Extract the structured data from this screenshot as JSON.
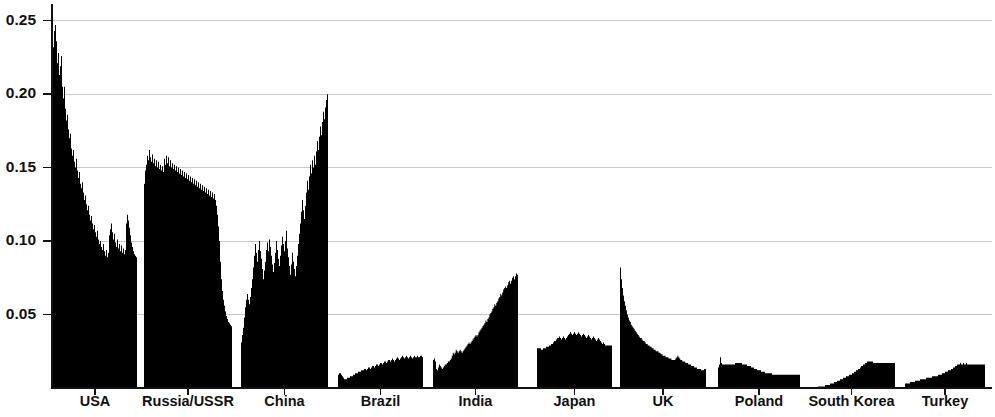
{
  "chart_data": {
    "type": "area",
    "title": "",
    "subtitle": "",
    "xlabel": "",
    "ylabel": "",
    "ylim": [
      0,
      0.26
    ],
    "grid": true,
    "legend_position": "none",
    "fill_color": "#000000",
    "grid_color": "#c8c8c8",
    "axis_color": "#111111",
    "y_ticks": [
      {
        "value": 0.05,
        "label": "0.05"
      },
      {
        "value": 0.1,
        "label": "0.10"
      },
      {
        "value": 0.15,
        "label": "0.15"
      },
      {
        "value": 0.2,
        "label": "0.20"
      },
      {
        "value": 0.25,
        "label": "0.25"
      }
    ],
    "categories": [
      "USA",
      "Russia/USSR",
      "China",
      "Brazil",
      "India",
      "Japan",
      "UK",
      "Poland",
      "South Korea",
      "Turkey"
    ],
    "panels": [
      {
        "name": "USA",
        "label": "USA",
        "x_start_px": 53,
        "x_end_px": 137,
        "peak_value": 0.247,
        "values": [
          0.232,
          0.243,
          0.247,
          0.236,
          0.221,
          0.228,
          0.213,
          0.219,
          0.226,
          0.205,
          0.197,
          0.205,
          0.19,
          0.182,
          0.186,
          0.176,
          0.17,
          0.173,
          0.163,
          0.158,
          0.162,
          0.154,
          0.15,
          0.156,
          0.148,
          0.143,
          0.147,
          0.139,
          0.136,
          0.14,
          0.133,
          0.128,
          0.131,
          0.125,
          0.121,
          0.124,
          0.118,
          0.114,
          0.117,
          0.112,
          0.108,
          0.111,
          0.106,
          0.103,
          0.107,
          0.101,
          0.098,
          0.1,
          0.096,
          0.094,
          0.098,
          0.093,
          0.09,
          0.094,
          0.089,
          0.092,
          0.104,
          0.108,
          0.112,
          0.106,
          0.101,
          0.105,
          0.099,
          0.096,
          0.101,
          0.095,
          0.098,
          0.093,
          0.097,
          0.092,
          0.095,
          0.091,
          0.094,
          0.112,
          0.118,
          0.114,
          0.109,
          0.104,
          0.099,
          0.096,
          0.093,
          0.091,
          0.09,
          0.089
        ]
      },
      {
        "name": "Russia/USSR",
        "label": "Russia/USSR",
        "x_start_px": 144,
        "x_end_px": 232,
        "peak_value": 0.162,
        "values": [
          0.139,
          0.148,
          0.152,
          0.158,
          0.155,
          0.162,
          0.157,
          0.154,
          0.159,
          0.153,
          0.156,
          0.151,
          0.155,
          0.15,
          0.154,
          0.149,
          0.152,
          0.148,
          0.151,
          0.147,
          0.156,
          0.152,
          0.158,
          0.153,
          0.157,
          0.151,
          0.155,
          0.15,
          0.153,
          0.149,
          0.152,
          0.148,
          0.151,
          0.147,
          0.15,
          0.146,
          0.149,
          0.145,
          0.148,
          0.144,
          0.147,
          0.143,
          0.146,
          0.142,
          0.145,
          0.141,
          0.144,
          0.14,
          0.143,
          0.139,
          0.142,
          0.138,
          0.141,
          0.137,
          0.14,
          0.136,
          0.139,
          0.135,
          0.138,
          0.134,
          0.137,
          0.133,
          0.136,
          0.132,
          0.135,
          0.131,
          0.134,
          0.13,
          0.133,
          0.129,
          0.132,
          0.128,
          0.124,
          0.118,
          0.11,
          0.1,
          0.086,
          0.074,
          0.066,
          0.06,
          0.056,
          0.052,
          0.049,
          0.047,
          0.045,
          0.044,
          0.043,
          0.042
        ]
      },
      {
        "name": "China",
        "label": "China",
        "x_start_px": 241,
        "x_end_px": 328,
        "peak_value": 0.2,
        "values": [
          0.031,
          0.036,
          0.041,
          0.048,
          0.055,
          0.06,
          0.064,
          0.06,
          0.057,
          0.062,
          0.068,
          0.074,
          0.082,
          0.09,
          0.098,
          0.092,
          0.086,
          0.094,
          0.1,
          0.093,
          0.088,
          0.081,
          0.074,
          0.08,
          0.086,
          0.094,
          0.099,
          0.093,
          0.101,
          0.096,
          0.09,
          0.084,
          0.079,
          0.085,
          0.092,
          0.1,
          0.094,
          0.088,
          0.083,
          0.09,
          0.097,
          0.103,
          0.098,
          0.093,
          0.1,
          0.107,
          0.095,
          0.089,
          0.083,
          0.077,
          0.084,
          0.092,
          0.086,
          0.081,
          0.076,
          0.083,
          0.09,
          0.098,
          0.105,
          0.112,
          0.12,
          0.128,
          0.121,
          0.115,
          0.124,
          0.133,
          0.141,
          0.135,
          0.144,
          0.152,
          0.146,
          0.155,
          0.15,
          0.158,
          0.152,
          0.161,
          0.168,
          0.162,
          0.171,
          0.178,
          0.172,
          0.181,
          0.188,
          0.183,
          0.191,
          0.196,
          0.2
        ]
      },
      {
        "name": "Brazil",
        "label": "Brazil",
        "x_start_px": 338,
        "x_end_px": 423,
        "peak_value": 0.022,
        "values": [
          0.009,
          0.01,
          0.01,
          0.009,
          0.008,
          0.007,
          0.006,
          0.006,
          0.006,
          0.007,
          0.007,
          0.007,
          0.008,
          0.008,
          0.008,
          0.009,
          0.009,
          0.01,
          0.01,
          0.01,
          0.011,
          0.011,
          0.011,
          0.012,
          0.012,
          0.012,
          0.013,
          0.013,
          0.012,
          0.013,
          0.014,
          0.014,
          0.013,
          0.014,
          0.015,
          0.015,
          0.014,
          0.015,
          0.016,
          0.016,
          0.015,
          0.016,
          0.017,
          0.017,
          0.016,
          0.017,
          0.018,
          0.018,
          0.017,
          0.018,
          0.019,
          0.019,
          0.018,
          0.019,
          0.02,
          0.019,
          0.018,
          0.019,
          0.02,
          0.021,
          0.02,
          0.019,
          0.02,
          0.021,
          0.022,
          0.021,
          0.02,
          0.021,
          0.022,
          0.021,
          0.02,
          0.021,
          0.022,
          0.021,
          0.02,
          0.021,
          0.022,
          0.021,
          0.021,
          0.022,
          0.021,
          0.021,
          0.022,
          0.022,
          0.021
        ]
      },
      {
        "name": "India",
        "label": "India",
        "x_start_px": 433,
        "x_end_px": 518,
        "peak_value": 0.078,
        "values": [
          0.019,
          0.02,
          0.018,
          0.013,
          0.012,
          0.014,
          0.016,
          0.015,
          0.014,
          0.013,
          0.014,
          0.015,
          0.016,
          0.016,
          0.017,
          0.018,
          0.018,
          0.019,
          0.02,
          0.022,
          0.024,
          0.023,
          0.024,
          0.026,
          0.025,
          0.024,
          0.025,
          0.026,
          0.025,
          0.024,
          0.025,
          0.026,
          0.027,
          0.028,
          0.029,
          0.03,
          0.031,
          0.03,
          0.031,
          0.032,
          0.033,
          0.034,
          0.035,
          0.036,
          0.035,
          0.036,
          0.038,
          0.039,
          0.04,
          0.041,
          0.042,
          0.043,
          0.044,
          0.046,
          0.045,
          0.047,
          0.048,
          0.05,
          0.051,
          0.052,
          0.054,
          0.055,
          0.057,
          0.056,
          0.058,
          0.059,
          0.061,
          0.062,
          0.064,
          0.063,
          0.065,
          0.067,
          0.068,
          0.069,
          0.068,
          0.07,
          0.072,
          0.073,
          0.071,
          0.073,
          0.075,
          0.076,
          0.074,
          0.076,
          0.078,
          0.077
        ]
      },
      {
        "name": "Japan",
        "label": "Japan",
        "x_start_px": 537,
        "x_end_px": 612,
        "peak_value": 0.038,
        "values": [
          0.027,
          0.027,
          0.027,
          0.027,
          0.026,
          0.026,
          0.027,
          0.027,
          0.027,
          0.028,
          0.028,
          0.028,
          0.029,
          0.029,
          0.03,
          0.03,
          0.031,
          0.032,
          0.032,
          0.033,
          0.034,
          0.034,
          0.035,
          0.034,
          0.033,
          0.034,
          0.035,
          0.034,
          0.033,
          0.034,
          0.035,
          0.036,
          0.037,
          0.038,
          0.037,
          0.036,
          0.037,
          0.038,
          0.037,
          0.036,
          0.037,
          0.038,
          0.037,
          0.036,
          0.035,
          0.036,
          0.037,
          0.036,
          0.035,
          0.034,
          0.035,
          0.036,
          0.035,
          0.034,
          0.033,
          0.034,
          0.035,
          0.034,
          0.033,
          0.032,
          0.033,
          0.034,
          0.033,
          0.032,
          0.031,
          0.03,
          0.031,
          0.03,
          0.029,
          0.029,
          0.029,
          0.029,
          0.029,
          0.029,
          0.029
        ]
      },
      {
        "name": "UK",
        "label": "UK",
        "x_start_px": 620,
        "x_end_px": 706,
        "peak_value": 0.082,
        "values": [
          0.082,
          0.074,
          0.068,
          0.063,
          0.059,
          0.056,
          0.053,
          0.05,
          0.048,
          0.046,
          0.045,
          0.043,
          0.042,
          0.041,
          0.04,
          0.039,
          0.038,
          0.037,
          0.036,
          0.035,
          0.034,
          0.034,
          0.033,
          0.032,
          0.032,
          0.031,
          0.03,
          0.03,
          0.029,
          0.029,
          0.028,
          0.028,
          0.027,
          0.027,
          0.026,
          0.026,
          0.025,
          0.025,
          0.025,
          0.024,
          0.024,
          0.023,
          0.023,
          0.022,
          0.022,
          0.022,
          0.021,
          0.021,
          0.021,
          0.02,
          0.02,
          0.02,
          0.019,
          0.019,
          0.019,
          0.019,
          0.02,
          0.021,
          0.022,
          0.021,
          0.02,
          0.019,
          0.019,
          0.018,
          0.018,
          0.018,
          0.017,
          0.017,
          0.017,
          0.016,
          0.016,
          0.016,
          0.015,
          0.015,
          0.015,
          0.014,
          0.014,
          0.014,
          0.013,
          0.013,
          0.013,
          0.013,
          0.012,
          0.012,
          0.012,
          0.013,
          0.013
        ]
      },
      {
        "name": "Poland",
        "label": "Poland",
        "x_start_px": 718,
        "x_end_px": 800,
        "peak_value": 0.021,
        "values": [
          0.014,
          0.016,
          0.021,
          0.017,
          0.016,
          0.016,
          0.016,
          0.016,
          0.016,
          0.016,
          0.016,
          0.016,
          0.016,
          0.016,
          0.016,
          0.016,
          0.016,
          0.017,
          0.017,
          0.017,
          0.017,
          0.017,
          0.017,
          0.017,
          0.016,
          0.016,
          0.016,
          0.016,
          0.016,
          0.015,
          0.015,
          0.015,
          0.015,
          0.014,
          0.014,
          0.014,
          0.013,
          0.013,
          0.013,
          0.012,
          0.012,
          0.012,
          0.012,
          0.011,
          0.011,
          0.011,
          0.011,
          0.01,
          0.01,
          0.01,
          0.01,
          0.01,
          0.01,
          0.01,
          0.009,
          0.009,
          0.009,
          0.009,
          0.009,
          0.009,
          0.009,
          0.009,
          0.009,
          0.009,
          0.009,
          0.009,
          0.009,
          0.009,
          0.009,
          0.009,
          0.009,
          0.009,
          0.009,
          0.009,
          0.009,
          0.009,
          0.009,
          0.009,
          0.009,
          0.009,
          0.009,
          0.009
        ]
      },
      {
        "name": "South Korea",
        "label": "South Korea",
        "x_start_px": 808,
        "x_end_px": 895,
        "peak_value": 0.018,
        "values": [
          0.0,
          0.0,
          0.0,
          0.0,
          0.0,
          0.0,
          0.0,
          0.0,
          0.0,
          0.0,
          0.001,
          0.001,
          0.001,
          0.001,
          0.001,
          0.001,
          0.001,
          0.002,
          0.002,
          0.002,
          0.002,
          0.002,
          0.003,
          0.003,
          0.003,
          0.003,
          0.004,
          0.004,
          0.004,
          0.005,
          0.005,
          0.005,
          0.006,
          0.006,
          0.006,
          0.007,
          0.007,
          0.007,
          0.008,
          0.008,
          0.008,
          0.009,
          0.009,
          0.009,
          0.01,
          0.01,
          0.011,
          0.011,
          0.012,
          0.012,
          0.013,
          0.013,
          0.014,
          0.015,
          0.015,
          0.016,
          0.016,
          0.017,
          0.017,
          0.018,
          0.018,
          0.018,
          0.018,
          0.018,
          0.018,
          0.017,
          0.017,
          0.017,
          0.017,
          0.017,
          0.017,
          0.017,
          0.017,
          0.017,
          0.017,
          0.017,
          0.017,
          0.017,
          0.017,
          0.017,
          0.017,
          0.017,
          0.017,
          0.017,
          0.017,
          0.017,
          0.017
        ]
      },
      {
        "name": "Turkey",
        "label": "Turkey",
        "x_start_px": 905,
        "x_end_px": 985,
        "peak_value": 0.017,
        "values": [
          0.003,
          0.003,
          0.003,
          0.003,
          0.003,
          0.004,
          0.004,
          0.004,
          0.004,
          0.004,
          0.005,
          0.005,
          0.005,
          0.005,
          0.005,
          0.006,
          0.006,
          0.006,
          0.006,
          0.006,
          0.006,
          0.007,
          0.007,
          0.007,
          0.007,
          0.007,
          0.007,
          0.008,
          0.008,
          0.008,
          0.008,
          0.008,
          0.008,
          0.009,
          0.009,
          0.009,
          0.009,
          0.01,
          0.01,
          0.01,
          0.011,
          0.011,
          0.011,
          0.012,
          0.012,
          0.012,
          0.013,
          0.013,
          0.014,
          0.014,
          0.015,
          0.015,
          0.016,
          0.016,
          0.016,
          0.017,
          0.016,
          0.016,
          0.017,
          0.016,
          0.016,
          0.017,
          0.016,
          0.016,
          0.016,
          0.016,
          0.016,
          0.016,
          0.016,
          0.016,
          0.016,
          0.016,
          0.016,
          0.016,
          0.016,
          0.016,
          0.016,
          0.016,
          0.016,
          0.016
        ]
      }
    ]
  },
  "geometry": {
    "plot_left_px": 52,
    "plot_right_px": 992,
    "plot_top_px": 6,
    "plot_bottom_px": 388,
    "y_max": 0.26,
    "ylabel_x_px": 45,
    "xlabel_y_px": 396
  }
}
